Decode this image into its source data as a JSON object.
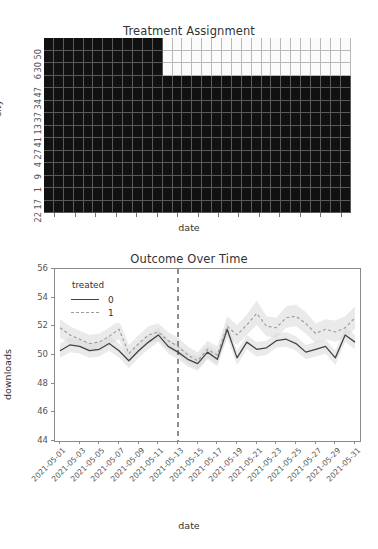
{
  "heatmap": {
    "title": "Treatment Assignment",
    "xlabel": "date",
    "ylabel": "city",
    "yticks": [
      "50",
      "30",
      "6",
      "47",
      "34",
      "37",
      "13",
      "41",
      "27",
      "4",
      "9",
      "1",
      "17",
      "22"
    ],
    "xtick_count": 15,
    "legend_note": "",
    "colors": {
      "untreated": "#111111",
      "treated": "#fbfbfb",
      "grid": "#5a5a5a"
    }
  },
  "line": {
    "title": "Outcome Over Time",
    "xlabel": "date",
    "ylabel": "downloads",
    "legend_title": "treated",
    "legend_items": [
      "0",
      "1"
    ],
    "yticks": [
      "44",
      "46",
      "48",
      "50",
      "52",
      "54",
      "56"
    ],
    "xticks": [
      "2021-05-01",
      "2021-05-03",
      "2021-05-05",
      "2021-05-07",
      "2021-05-09",
      "2021-05-11",
      "2021-05-13",
      "2021-05-15",
      "2021-05-17",
      "2021-05-19",
      "2021-05-21",
      "2021-05-23",
      "2021-05-25",
      "2021-05-27",
      "2021-05-29",
      "2021-05-31"
    ],
    "intervention_date": "2021-05-13",
    "colors": {
      "control": "#444444",
      "treated": "#9a9a9a",
      "band": "#d8d8d8",
      "vline": "#444444"
    }
  },
  "chart_data": {
    "type": "line",
    "title": "Outcome Over Time",
    "xlabel": "date",
    "ylabel": "downloads",
    "ylim": [
      44,
      56
    ],
    "grid": false,
    "legend_position": "upper-left",
    "legend_title": "treated",
    "x": [
      "2021-05-01",
      "2021-05-02",
      "2021-05-03",
      "2021-05-04",
      "2021-05-05",
      "2021-05-06",
      "2021-05-07",
      "2021-05-08",
      "2021-05-09",
      "2021-05-10",
      "2021-05-11",
      "2021-05-12",
      "2021-05-13",
      "2021-05-14",
      "2021-05-15",
      "2021-05-16",
      "2021-05-17",
      "2021-05-18",
      "2021-05-19",
      "2021-05-20",
      "2021-05-21",
      "2021-05-22",
      "2021-05-23",
      "2021-05-24",
      "2021-05-25",
      "2021-05-26",
      "2021-05-27",
      "2021-05-28",
      "2021-05-29",
      "2021-05-30",
      "2021-05-31"
    ],
    "series": [
      {
        "name": "0",
        "style": "solid",
        "values": [
          50.3,
          50.7,
          50.6,
          50.3,
          50.4,
          50.8,
          50.3,
          49.6,
          50.3,
          50.9,
          51.4,
          50.6,
          50.2,
          49.7,
          49.4,
          50.2,
          49.7,
          51.8,
          49.8,
          50.9,
          50.4,
          50.5,
          51.0,
          51.1,
          50.8,
          50.2,
          50.4,
          50.6,
          49.8,
          51.4,
          50.9
        ],
        "ci_low": [
          49.8,
          50.2,
          50.1,
          49.8,
          49.9,
          50.3,
          49.8,
          49.1,
          49.8,
          50.4,
          50.9,
          50.1,
          49.7,
          49.2,
          48.9,
          49.7,
          49.2,
          51.2,
          49.3,
          50.4,
          49.9,
          50.0,
          50.5,
          50.6,
          50.3,
          49.7,
          49.9,
          50.1,
          49.3,
          50.9,
          50.4
        ],
        "ci_high": [
          50.8,
          51.2,
          51.1,
          50.8,
          50.9,
          51.3,
          50.8,
          50.1,
          50.8,
          51.4,
          51.9,
          51.1,
          50.7,
          50.2,
          49.9,
          50.7,
          50.2,
          52.3,
          50.3,
          51.4,
          50.9,
          51.0,
          51.5,
          51.6,
          51.3,
          50.7,
          50.9,
          51.1,
          50.3,
          51.9,
          51.4
        ]
      },
      {
        "name": "1",
        "style": "dashed",
        "values": [
          51.9,
          51.4,
          51.1,
          50.8,
          50.9,
          51.3,
          51.8,
          50.1,
          50.8,
          51.4,
          51.6,
          51.0,
          50.6,
          50.0,
          49.6,
          50.4,
          50.0,
          52.0,
          51.4,
          52.1,
          52.9,
          52.0,
          51.9,
          52.6,
          52.7,
          52.2,
          51.5,
          51.8,
          51.6,
          51.9,
          52.6
        ],
        "ci_low": [
          51.2,
          50.8,
          50.5,
          50.2,
          50.3,
          50.7,
          51.1,
          49.5,
          50.2,
          50.8,
          51.0,
          50.4,
          50.0,
          49.4,
          49.0,
          49.8,
          49.4,
          51.3,
          50.7,
          51.4,
          52.1,
          51.3,
          51.2,
          51.9,
          52.0,
          51.5,
          50.8,
          51.1,
          50.9,
          51.2,
          51.8
        ],
        "ci_high": [
          52.5,
          52.0,
          51.7,
          51.4,
          51.5,
          51.9,
          52.4,
          50.7,
          51.4,
          52.0,
          52.2,
          51.6,
          51.2,
          50.6,
          50.2,
          51.0,
          50.6,
          52.7,
          52.1,
          52.8,
          53.8,
          52.7,
          52.6,
          53.4,
          53.5,
          53.0,
          52.2,
          52.5,
          52.4,
          52.7,
          53.4
        ]
      }
    ],
    "annotations": [
      {
        "type": "vline",
        "x": "2021-05-13",
        "style": "dashed",
        "label": ""
      }
    ]
  }
}
